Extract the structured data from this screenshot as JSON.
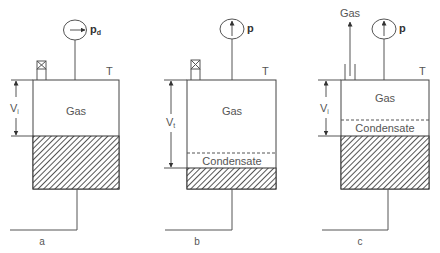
{
  "diagram": {
    "type": "process-schematic",
    "panels": [
      {
        "id": "a",
        "caption": "a",
        "gauge_label": "p",
        "gauge_subscript": "d",
        "gauge_arrow": "right",
        "temperature_label": "T",
        "top_element": "valve",
        "volume_label": "V",
        "volume_subscript": "i",
        "layers": [
          {
            "name": "gas",
            "label": "Gas"
          },
          {
            "name": "hatched-fluid",
            "label": ""
          }
        ]
      },
      {
        "id": "b",
        "caption": "b",
        "gauge_label": "p",
        "gauge_subscript": "",
        "gauge_arrow": "up",
        "temperature_label": "T",
        "top_element": "valve",
        "volume_label": "V",
        "volume_subscript": "t",
        "layers": [
          {
            "name": "gas",
            "label": "Gas"
          },
          {
            "name": "condensate",
            "label": "Condensate"
          },
          {
            "name": "hatched-fluid",
            "label": ""
          }
        ]
      },
      {
        "id": "c",
        "caption": "c",
        "gauge_label": "p",
        "gauge_subscript": "",
        "gauge_arrow": "up",
        "temperature_label": "T",
        "top_element": "gas-outlet",
        "outlet_label": "Gas",
        "volume_label": "V",
        "volume_subscript": "i",
        "layers": [
          {
            "name": "gas",
            "label": "Gas"
          },
          {
            "name": "condensate",
            "label": "Condensate"
          },
          {
            "name": "hatched-fluid",
            "label": ""
          }
        ]
      }
    ]
  },
  "colors": {
    "line": "#555555",
    "hatch": "#333333",
    "background": "#ffffff"
  }
}
